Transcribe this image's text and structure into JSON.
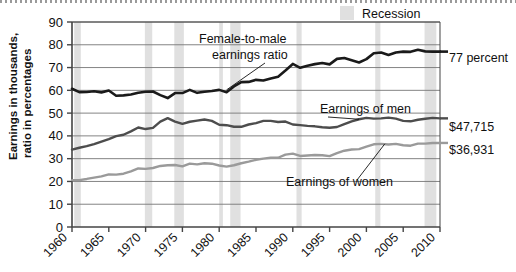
{
  "chart_data": {
    "type": "line",
    "title": "",
    "xlabel": "",
    "ylabel": "Earnings in thousands,\nratio in percentages",
    "ylabel_line1": "Earnings in thousands,",
    "ylabel_line2": "ratio in percentages",
    "xlim": [
      1960,
      2010
    ],
    "ylim": [
      0,
      90
    ],
    "yticks": [
      0,
      10,
      20,
      30,
      40,
      50,
      60,
      70,
      80,
      90
    ],
    "xticks": [
      1960,
      1965,
      1970,
      1975,
      1980,
      1985,
      1990,
      1995,
      2000,
      2005,
      2010
    ],
    "grid": "horizontal",
    "legend_position": "top-right",
    "x": [
      1960,
      1961,
      1962,
      1963,
      1964,
      1965,
      1966,
      1967,
      1968,
      1969,
      1970,
      1971,
      1972,
      1973,
      1974,
      1975,
      1976,
      1977,
      1978,
      1979,
      1980,
      1981,
      1982,
      1983,
      1984,
      1985,
      1986,
      1987,
      1988,
      1989,
      1990,
      1991,
      1992,
      1993,
      1994,
      1995,
      1996,
      1997,
      1998,
      1999,
      2000,
      2001,
      2002,
      2003,
      2004,
      2005,
      2006,
      2007,
      2008,
      2009,
      2010
    ],
    "series": [
      {
        "name": "Female-to-male earnings ratio",
        "unit": "percent",
        "color": "#1a1a1a",
        "values": [
          60.7,
          59.2,
          59.3,
          59.6,
          59.1,
          59.9,
          57.6,
          57.8,
          58.2,
          58.9,
          59.4,
          59.5,
          57.9,
          56.6,
          58.8,
          58.8,
          60.2,
          58.9,
          59.4,
          59.7,
          60.2,
          59.2,
          61.7,
          63.6,
          63.7,
          64.6,
          64.3,
          65.2,
          66.0,
          68.7,
          71.6,
          69.9,
          70.8,
          71.5,
          72.0,
          71.4,
          73.8,
          74.2,
          73.2,
          72.2,
          73.7,
          76.3,
          76.6,
          75.5,
          76.6,
          77.0,
          76.9,
          77.8,
          77.1,
          77.0,
          77.0
        ]
      },
      {
        "name": "Earnings of men",
        "unit": "thousands of dollars",
        "color": "#4d4d4d",
        "values": [
          34.0,
          34.8,
          35.5,
          36.4,
          37.5,
          38.6,
          39.9,
          40.5,
          42.0,
          43.7,
          43.0,
          43.5,
          46.3,
          47.8,
          46.3,
          45.3,
          46.2,
          46.7,
          47.2,
          46.6,
          44.9,
          44.7,
          44.0,
          44.0,
          45.0,
          45.6,
          46.6,
          46.6,
          46.1,
          46.3,
          45.0,
          44.7,
          44.4,
          44.2,
          43.8,
          43.6,
          43.9,
          45.2,
          46.4,
          47.3,
          47.9,
          47.6,
          47.7,
          48.0,
          47.6,
          46.6,
          46.4,
          47.1,
          47.5,
          47.9,
          47.7
        ]
      },
      {
        "name": "Earnings of women",
        "unit": "thousands of dollars",
        "color": "#9a9a9a",
        "values": [
          20.6,
          20.6,
          21.1,
          21.7,
          22.2,
          23.1,
          23.0,
          23.4,
          24.4,
          25.7,
          25.5,
          25.9,
          26.8,
          27.1,
          27.2,
          26.6,
          27.8,
          27.5,
          28.0,
          27.8,
          27.0,
          26.5,
          27.1,
          28.0,
          28.7,
          29.5,
          30.0,
          30.4,
          30.4,
          31.8,
          32.2,
          31.2,
          31.4,
          31.6,
          31.5,
          31.1,
          32.4,
          33.5,
          34.0,
          34.2,
          35.3,
          36.3,
          36.5,
          36.2,
          36.5,
          35.9,
          35.7,
          36.6,
          36.6,
          36.9,
          36.9
        ]
      }
    ],
    "recessions": [
      {
        "start": 1960.3,
        "end": 1961.2
      },
      {
        "start": 1969.9,
        "end": 1970.9
      },
      {
        "start": 1973.9,
        "end": 1975.2
      },
      {
        "start": 1980.0,
        "end": 1980.5
      },
      {
        "start": 1981.5,
        "end": 1982.9
      },
      {
        "start": 1990.5,
        "end": 1991.2
      },
      {
        "start": 2001.2,
        "end": 2001.9
      },
      {
        "start": 2007.9,
        "end": 2009.5
      }
    ],
    "annotations": [
      {
        "id": "ratio",
        "line1": "Female-to-male",
        "line2": "earnings ratio"
      },
      {
        "id": "men",
        "text": "Earnings of men"
      },
      {
        "id": "women",
        "text": "Earnings of women"
      }
    ],
    "end_labels": [
      {
        "id": "ratio-end",
        "text": "77 percent"
      },
      {
        "id": "men-end",
        "text": "$47,715"
      },
      {
        "id": "women-end",
        "text": "$36,931"
      }
    ],
    "legend": [
      {
        "id": "recession",
        "label": "Recession",
        "color": "#e0e0e0"
      }
    ]
  }
}
